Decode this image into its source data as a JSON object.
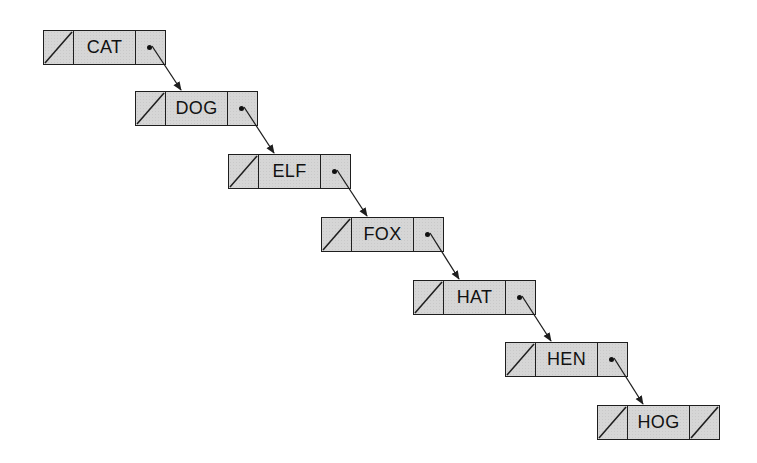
{
  "diagram": {
    "type": "linked-list",
    "colors": {
      "node_fill": "#d6d6d6",
      "border": "#1e1e1e",
      "text": "#111111"
    },
    "nodes": [
      {
        "label": "CAT",
        "prev": "null",
        "next": "pointer"
      },
      {
        "label": "DOG",
        "prev": "null",
        "next": "pointer"
      },
      {
        "label": "ELF",
        "prev": "null",
        "next": "pointer"
      },
      {
        "label": "FOX",
        "prev": "null",
        "next": "pointer"
      },
      {
        "label": "HAT",
        "prev": "null",
        "next": "pointer"
      },
      {
        "label": "HEN",
        "prev": "null",
        "next": "pointer"
      },
      {
        "label": "HOG",
        "prev": "null",
        "next": "null"
      }
    ]
  }
}
